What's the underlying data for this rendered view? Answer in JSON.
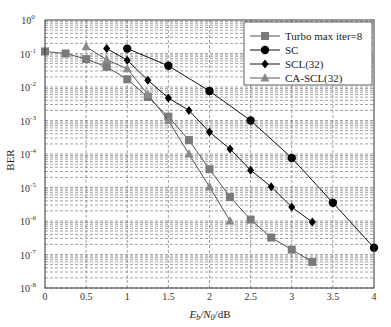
{
  "chart_data": {
    "type": "line",
    "title": "",
    "xlabel": "E_b/N_0/dB",
    "ylabel": "BER",
    "xlim": [
      0,
      4
    ],
    "ylim": [
      1e-08,
      1
    ],
    "yscale": "log",
    "grid": true,
    "legend_position": "upper right",
    "x_ticks": [
      "0",
      "0.5",
      "1",
      "1.5",
      "2",
      "2.5",
      "3",
      "3.5",
      "4"
    ],
    "y_ticks": [
      "10^0",
      "10^-1",
      "10^-2",
      "10^-3",
      "10^-4",
      "10^-5",
      "10^-6",
      "10^-7",
      "10^-8"
    ],
    "series": [
      {
        "name": "Turbo max iter=8",
        "marker": "square",
        "color": "#7a7a7a",
        "x": [
          0,
          0.25,
          0.5,
          0.75,
          1,
          1.25,
          1.5,
          1.75,
          2,
          2.25,
          2.5,
          2.75,
          3,
          3.25
        ],
        "values": [
          0.115,
          0.1,
          0.068,
          0.04,
          0.017,
          0.005,
          0.0013,
          0.00026,
          3.5e-05,
          5.2e-06,
          1.1e-06,
          3.2e-07,
          1.4e-07,
          6e-08
        ]
      },
      {
        "name": "SC",
        "marker": "circle",
        "color": "#000000",
        "x": [
          1,
          1.5,
          2,
          2.5,
          3,
          3.5,
          4
        ],
        "values": [
          0.14,
          0.043,
          0.0076,
          0.001,
          7.6e-05,
          3.5e-06,
          1.6e-07
        ]
      },
      {
        "name": "SCL(32)",
        "marker": "diamond",
        "color": "#000000",
        "x": [
          0.75,
          1,
          1.25,
          1.5,
          1.75,
          2,
          2.25,
          2.5,
          2.75,
          3,
          3.25
        ],
        "values": [
          0.14,
          0.063,
          0.016,
          0.0047,
          0.002,
          0.00045,
          0.00014,
          3.3e-05,
          1.05e-05,
          2.6e-06,
          9.3e-07
        ]
      },
      {
        "name": "CA-SCL(32)",
        "marker": "triangle",
        "color": "#8a8a8a",
        "x": [
          0.5,
          0.75,
          1,
          1.25,
          1.5,
          1.75,
          2,
          2.25
        ],
        "values": [
          0.16,
          0.065,
          0.035,
          0.006,
          0.001,
          0.0001,
          1.05e-05,
          1e-06
        ]
      }
    ]
  },
  "axes": {
    "ylabel": "BER",
    "xlabel_main": "E",
    "xlabel_sub1": "b",
    "xlabel_mid": "/N",
    "xlabel_sub2": "0",
    "xlabel_unit": "/dB"
  },
  "legend": {
    "items": [
      "Turbo max iter=8",
      "SC",
      "SCL(32)",
      "CA-SCL(32)"
    ]
  }
}
